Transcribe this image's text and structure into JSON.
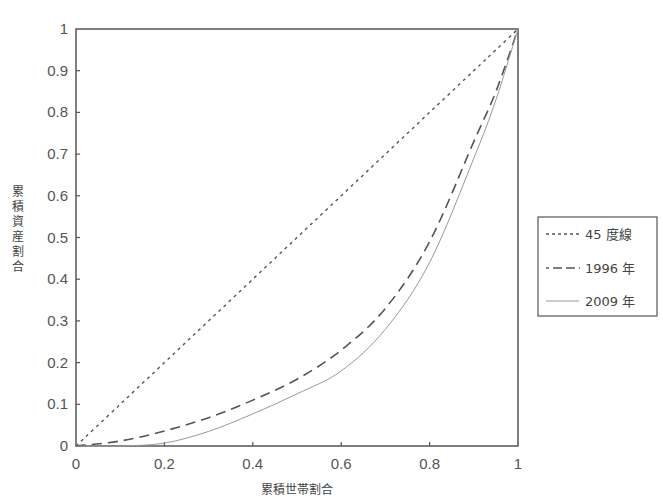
{
  "chart_data": {
    "type": "line",
    "title": "",
    "xlabel": "累積世帯割合",
    "ylabel": "累積資産割合",
    "xlim": [
      0,
      1
    ],
    "ylim": [
      0,
      1
    ],
    "x_ticks": [
      "0",
      "0.2",
      "0.4",
      "0.6",
      "0.8",
      "1"
    ],
    "y_ticks": [
      "0",
      "0.1",
      "0.2",
      "0.3",
      "0.4",
      "0.5",
      "0.6",
      "0.7",
      "0.8",
      "0.9",
      "1"
    ],
    "grid": false,
    "legend_position": "right",
    "x": [
      0,
      0.1,
      0.2,
      0.3,
      0.4,
      0.5,
      0.6,
      0.7,
      0.8,
      0.9,
      0.95,
      1
    ],
    "series": [
      {
        "name": "45 度線",
        "style": "dotted",
        "color": "#555555",
        "values": [
          0,
          0.1,
          0.2,
          0.3,
          0.4,
          0.5,
          0.6,
          0.7,
          0.8,
          0.9,
          0.95,
          1
        ]
      },
      {
        "name": "1996 年",
        "style": "dashed",
        "color": "#555555",
        "values": [
          0,
          0.012,
          0.036,
          0.068,
          0.11,
          0.16,
          0.23,
          0.33,
          0.49,
          0.73,
          0.85,
          1
        ]
      },
      {
        "name": "2009 年",
        "style": "solid",
        "color": "#999999",
        "values": [
          0,
          0.0,
          0.007,
          0.035,
          0.077,
          0.125,
          0.18,
          0.28,
          0.44,
          0.69,
          0.83,
          1
        ]
      }
    ]
  },
  "legend": {
    "items": [
      {
        "label": "45 度線"
      },
      {
        "label": "1996 年"
      },
      {
        "label": "2009 年"
      }
    ]
  }
}
